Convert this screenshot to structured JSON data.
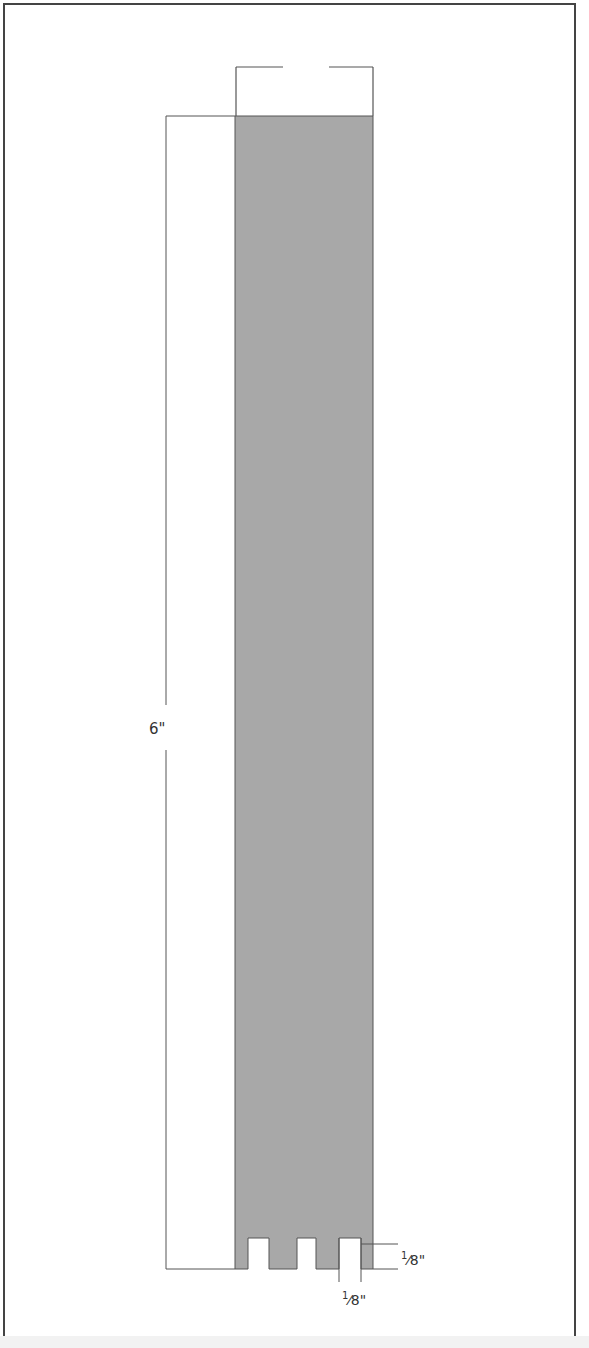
{
  "diagram": {
    "type": "technical-drawing",
    "colors": {
      "fill": "#a8a8a8",
      "line": "#444444",
      "frame": "#444444"
    },
    "dimensions": {
      "height_label": "6\"",
      "notch_depth": {
        "num": "1",
        "den": "8",
        "unit": "\""
      },
      "notch_width": {
        "num": "1",
        "den": "8",
        "unit": "\""
      }
    },
    "notch_count": 3
  }
}
